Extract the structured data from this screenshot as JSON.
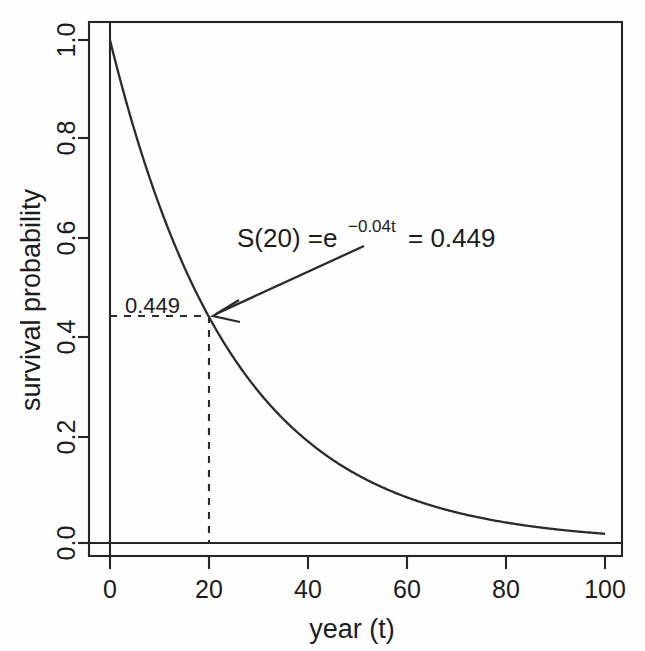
{
  "chart_data": {
    "type": "line",
    "title": "",
    "xlabel": "year (t)",
    "ylabel": "survival probability",
    "xlim": [
      -4,
      104
    ],
    "ylim": [
      -0.03,
      1.04
    ],
    "grid": false,
    "legend": null,
    "function": "S(t) = e^(-0.04t)",
    "rate": 0.04,
    "x": [
      0,
      5,
      10,
      15,
      20,
      25,
      30,
      35,
      40,
      45,
      50,
      55,
      60,
      65,
      70,
      75,
      80,
      85,
      90,
      95,
      100
    ],
    "y": [
      1.0,
      0.819,
      0.67,
      0.549,
      0.449,
      0.368,
      0.301,
      0.247,
      0.202,
      0.165,
      0.135,
      0.111,
      0.091,
      0.074,
      0.061,
      0.05,
      0.041,
      0.033,
      0.027,
      0.022,
      0.018
    ],
    "series": [
      {
        "name": "S(t) = e^(-0.04t)",
        "values": [
          1.0,
          0.819,
          0.67,
          0.549,
          0.449,
          0.368,
          0.301,
          0.247,
          0.202,
          0.165,
          0.135,
          0.111,
          0.091,
          0.074,
          0.061,
          0.05,
          0.041,
          0.033,
          0.027,
          0.022,
          0.018
        ]
      }
    ],
    "xticks": [
      "0",
      "20",
      "40",
      "60",
      "80",
      "100"
    ],
    "xtick_values": [
      0,
      20,
      40,
      60,
      80,
      100
    ],
    "yticks": [
      "0.0",
      "0.2",
      "0.4",
      "0.6",
      "0.8",
      "1.0"
    ],
    "ytick_values": [
      0.0,
      0.2,
      0.4,
      0.6,
      0.8,
      1.0
    ],
    "annotations": [
      {
        "name": "survival-equation",
        "prefix": "S(20) =e",
        "superscript": "−0.04t",
        "suffix": "= 0.449",
        "point": [
          20,
          0.449
        ]
      },
      {
        "name": "highlight-value",
        "text": "0.449",
        "point": [
          20,
          0.449
        ]
      }
    ],
    "reference_lines": [
      {
        "name": "zero-baseline",
        "axis": "y",
        "value": 0.0,
        "style": "solid"
      },
      {
        "name": "t-zero-vertical",
        "axis": "x",
        "value": 0.0,
        "style": "solid"
      },
      {
        "name": "survival-horizontal-guide",
        "axis": "y",
        "value": 0.449,
        "style": "dashed"
      },
      {
        "name": "survival-vertical-guide",
        "axis": "x",
        "value": 20,
        "style": "dashed"
      }
    ],
    "colors": {
      "background": "#fefefe",
      "curve": "#2b2b2b",
      "axis": "#262626",
      "text": "#1c1c1c"
    }
  }
}
